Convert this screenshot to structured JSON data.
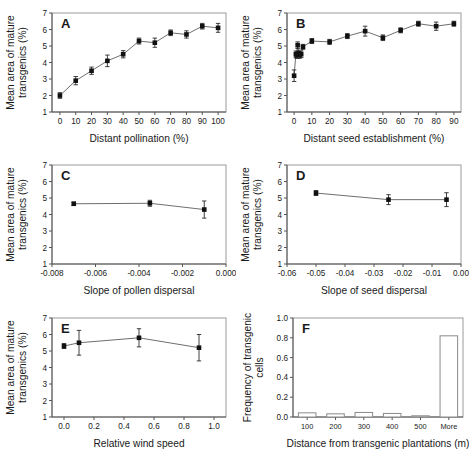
{
  "figure": {
    "title": "",
    "panels": [
      "A",
      "B",
      "C",
      "D",
      "E",
      "F"
    ]
  },
  "chart_data": [
    {
      "panel": "A",
      "type": "line",
      "title": "",
      "xlabel": "Distant pollination (%)",
      "ylabel": "Mean area of mature transgenics (%)",
      "xlim": [
        -5,
        105
      ],
      "ylim": [
        1,
        7
      ],
      "xticks": [
        0,
        10,
        20,
        30,
        40,
        50,
        60,
        70,
        80,
        90,
        100
      ],
      "yticks": [
        1,
        2,
        3,
        4,
        5,
        6,
        7
      ],
      "grid": false,
      "legend": "none",
      "x": [
        0,
        10,
        20,
        30,
        40,
        50,
        60,
        70,
        80,
        90,
        100
      ],
      "values": [
        2.0,
        2.9,
        3.5,
        4.1,
        4.5,
        5.3,
        5.2,
        5.8,
        5.7,
        6.2,
        6.1
      ],
      "errors": [
        0.17,
        0.25,
        0.22,
        0.35,
        0.22,
        0.18,
        0.28,
        0.17,
        0.22,
        0.17,
        0.27
      ]
    },
    {
      "panel": "B",
      "type": "line",
      "title": "",
      "xlabel": "Distant seed establishment (%)",
      "ylabel": "Mean area of mature transgenics (%)",
      "xlim": [
        -4,
        94
      ],
      "ylim": [
        1,
        7
      ],
      "xticks": [
        0,
        10,
        20,
        30,
        40,
        50,
        60,
        70,
        80,
        90
      ],
      "yticks": [
        1,
        2,
        3,
        4,
        5,
        6,
        7
      ],
      "grid": false,
      "legend": "none",
      "x": [
        0,
        1,
        1.5,
        2,
        2.5,
        3,
        4,
        5,
        10,
        20,
        30,
        40,
        50,
        60,
        70,
        80,
        90
      ],
      "values": [
        3.2,
        4.5,
        4.45,
        5.05,
        4.55,
        4.45,
        4.5,
        4.95,
        5.3,
        5.25,
        5.6,
        5.9,
        5.5,
        5.95,
        6.35,
        6.2,
        6.35
      ],
      "errors": [
        0.35,
        0.2,
        0.2,
        0.2,
        0.2,
        0.2,
        0.2,
        0.15,
        0.15,
        0.15,
        0.15,
        0.3,
        0.17,
        0.15,
        0.15,
        0.25,
        0.15
      ]
    },
    {
      "panel": "C",
      "type": "line",
      "title": "",
      "xlabel": "Slope of pollen dispersal",
      "ylabel": "Mean area of mature transgenics (%)",
      "xlim": [
        -0.008,
        0.0
      ],
      "ylim": [
        1,
        7
      ],
      "xticks": [
        -0.008,
        -0.006,
        -0.004,
        -0.002,
        0.0
      ],
      "xticklabels": [
        "-0.008",
        "-0.006",
        "-0.004",
        "-0.002",
        "0.000"
      ],
      "yticks": [
        1,
        2,
        3,
        4,
        5,
        6,
        7
      ],
      "grid": false,
      "legend": "none",
      "x": [
        -0.007,
        -0.0035,
        -0.001
      ],
      "values": [
        4.65,
        4.68,
        4.3
      ],
      "errors": [
        0.1,
        0.18,
        0.52
      ]
    },
    {
      "panel": "D",
      "type": "line",
      "title": "",
      "xlabel": "Slope of seed dispersal",
      "ylabel": "Mean area of mature transgenics (%)",
      "xlim": [
        -0.06,
        0.0
      ],
      "ylim": [
        1,
        7
      ],
      "xticks": [
        -0.06,
        -0.05,
        -0.04,
        -0.03,
        -0.02,
        -0.01,
        0.0
      ],
      "xticklabels": [
        "-0.06",
        "-0.05",
        "-0.04",
        "-0.03",
        "-0.02",
        "-0.01",
        "0.00"
      ],
      "yticks": [
        1,
        2,
        3,
        4,
        5,
        6,
        7
      ],
      "grid": false,
      "legend": "none",
      "x": [
        -0.05,
        -0.025,
        -0.005
      ],
      "values": [
        5.3,
        4.9,
        4.9
      ],
      "errors": [
        0.15,
        0.3,
        0.42
      ]
    },
    {
      "panel": "E",
      "type": "line",
      "title": "",
      "xlabel": "Relative wind speed",
      "ylabel": "Mean area of mature transgenics (%)",
      "xlim": [
        -0.08,
        1.08
      ],
      "ylim": [
        1,
        7
      ],
      "xticks": [
        0.0,
        0.2,
        0.4,
        0.6,
        0.8,
        1.0
      ],
      "xticklabels": [
        "0.0",
        "0.2",
        "0.4",
        "0.6",
        "0.8",
        "1.0"
      ],
      "yticks": [
        1,
        2,
        3,
        4,
        5,
        6,
        7
      ],
      "grid": false,
      "legend": "none",
      "x": [
        0.0,
        0.1,
        0.5,
        0.9
      ],
      "values": [
        5.3,
        5.5,
        5.8,
        5.2
      ],
      "errors": [
        0.15,
        0.75,
        0.55,
        0.8
      ]
    },
    {
      "panel": "F",
      "type": "bar",
      "title": "",
      "xlabel": "Distance from transgenic plantations (m)",
      "ylabel": "Frequency of transgenic cells",
      "categories": [
        "100",
        "200",
        "300",
        "400",
        "500",
        "More"
      ],
      "values": [
        0.042,
        0.032,
        0.046,
        0.036,
        0.01,
        0.82
      ],
      "ylim": [
        0.0,
        1.0
      ],
      "yticks": [
        0.0,
        0.2,
        0.4,
        0.6,
        0.8,
        1.0
      ],
      "yticklabels": [
        "0.0",
        "0.2",
        "0.4",
        "0.6",
        "0.8",
        "1.0"
      ],
      "grid": false,
      "legend": "none"
    }
  ]
}
